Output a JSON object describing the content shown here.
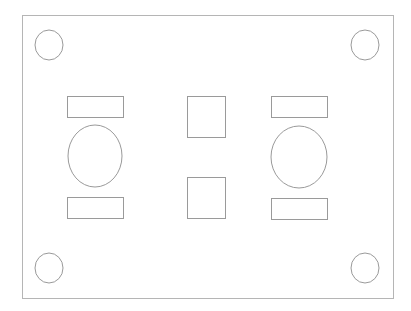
{
  "diagram": {
    "title": "",
    "stroke_color": "#9a9a9a",
    "outer_stroke_color": "#b5b5b5",
    "background": "#ffffff",
    "outer_board": {
      "x": 22,
      "y": 15,
      "w": 371,
      "h": 283
    },
    "mounting_holes": [
      {
        "cx": 49,
        "cy": 45,
        "rx": 14,
        "ry": 15
      },
      {
        "cx": 365,
        "cy": 45,
        "rx": 14,
        "ry": 15
      },
      {
        "cx": 49,
        "cy": 268,
        "rx": 14,
        "ry": 15
      },
      {
        "cx": 365,
        "cy": 268,
        "rx": 14,
        "ry": 15
      }
    ],
    "left_group": {
      "top_rect": {
        "x": 67,
        "y": 96,
        "w": 56,
        "h": 21
      },
      "ellipse": {
        "cx": 95,
        "cy": 156,
        "rx": 27,
        "ry": 31
      },
      "bottom_rect": {
        "x": 67,
        "y": 197,
        "w": 56,
        "h": 21
      }
    },
    "center_squares": [
      {
        "x": 187,
        "y": 96,
        "w": 38,
        "h": 41
      },
      {
        "x": 187,
        "y": 177,
        "w": 38,
        "h": 41
      }
    ],
    "right_group": {
      "top_rect": {
        "x": 271,
        "y": 96,
        "w": 56,
        "h": 21
      },
      "ellipse": {
        "cx": 299,
        "cy": 157,
        "rx": 28,
        "ry": 31
      },
      "bottom_rect": {
        "x": 271,
        "y": 198,
        "w": 56,
        "h": 21
      }
    }
  }
}
